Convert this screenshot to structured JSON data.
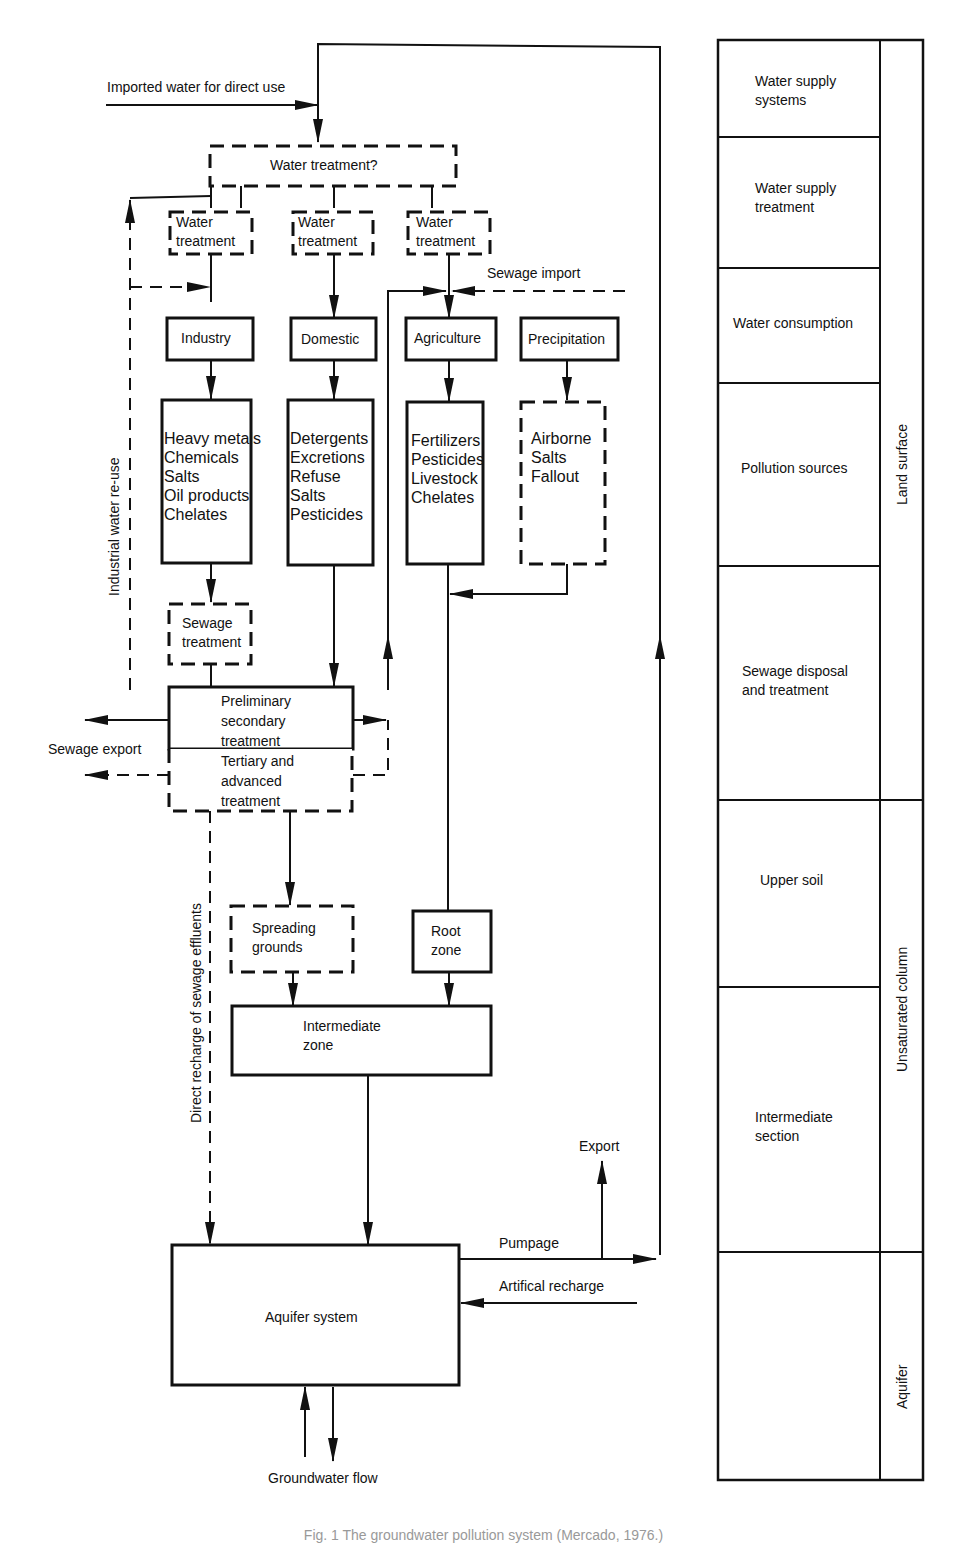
{
  "figure": {
    "caption": "Fig. 1 The groundwater pollution system (Mercado, 1976.)"
  },
  "flow": {
    "imported_water": "Imported water for direct use",
    "water_treatment_question": "Water treatment?",
    "water_treatment_boxes": [
      {
        "line1": "Water",
        "line2": "treatment"
      },
      {
        "line1": "Water",
        "line2": "treatment"
      },
      {
        "line1": "Water",
        "line2": "treatment"
      }
    ],
    "sewage_import": "Sewage import",
    "industrial_reuse": "Industrial water re-use",
    "sources": [
      {
        "name": "Industry",
        "pollutants": "Heavy metals\nChemicals\nSalts\nOil products\nChelates"
      },
      {
        "name": "Domestic",
        "pollutants": "Detergents\nExcretions\nRefuse\nSalts\nPesticides"
      },
      {
        "name": "Agriculture",
        "pollutants": "Fertilizers\nPesticides\nLivestock\nChelates"
      },
      {
        "name": "Precipitation",
        "pollutants": "Airborne\nSalts\nFallout"
      }
    ],
    "sewage_treatment": {
      "line1": "Sewage",
      "line2": "treatment"
    },
    "preliminary": {
      "line1": "Preliminary",
      "line2": "secondary",
      "line3": "treatment"
    },
    "tertiary": {
      "line1": "Tertiary and",
      "line2": "advanced",
      "line3": "treatment"
    },
    "sewage_export": "Sewage export",
    "direct_recharge": "Direct recharge of sewage effluents",
    "spreading_grounds": {
      "line1": "Spreading",
      "line2": "grounds"
    },
    "root_zone": {
      "line1": "Root",
      "line2": "zone"
    },
    "intermediate_zone": {
      "line1": "Intermediate",
      "line2": "zone"
    },
    "aquifer_system": "Aquifer system",
    "export": "Export",
    "pumpage": "Pumpage",
    "artificial_recharge": "Artifical recharge",
    "groundwater_flow": "Groundwater flow"
  },
  "legend_column": {
    "stages": [
      {
        "line1": "Water supply",
        "line2": "systems"
      },
      {
        "line1": "Water supply",
        "line2": "treatment"
      },
      {
        "line1": "Water consumption",
        "line2": ""
      },
      {
        "line1": "Pollution sources",
        "line2": ""
      },
      {
        "line1": "Sewage disposal",
        "line2": "and treatment"
      },
      {
        "line1": "Upper soil",
        "line2": ""
      },
      {
        "line1": "Intermediate",
        "line2": "section"
      },
      {
        "line1": "",
        "line2": ""
      }
    ],
    "zones": [
      "Land surface",
      "Unsaturated column",
      "Aquifer"
    ]
  }
}
